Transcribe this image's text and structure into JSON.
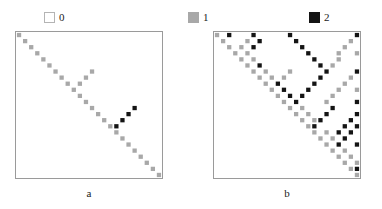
{
  "figure": {
    "width": 382,
    "height": 209,
    "background": "#ffffff"
  },
  "legend": {
    "items": [
      {
        "label": "0",
        "value": 0,
        "color": "#ffffff",
        "border": "#b4b4b4",
        "swatch_name": "legend-swatch-zero"
      },
      {
        "label": "1",
        "value": 1,
        "color": "#a8a8a8",
        "border": "#a8a8a8",
        "swatch_name": "legend-swatch-one"
      },
      {
        "label": "2",
        "value": 2,
        "color": "#141414",
        "border": "#141414",
        "swatch_name": "legend-swatch-two"
      }
    ]
  },
  "panels": [
    {
      "id": "a",
      "caption": "a",
      "matrix_border_color": "#9a9a9a"
    },
    {
      "id": "b",
      "caption": "b",
      "matrix_border_color": "#9a9a9a"
    }
  ],
  "chart_data": [
    {
      "type": "heatmap",
      "title": "a",
      "xlabel": "",
      "ylabel": "",
      "grid": false,
      "legend_position": "top",
      "n_rows": 24,
      "n_cols": 24,
      "value_colors": {
        "0": "#ffffff",
        "1": "#a8a8a8",
        "2": "#141414"
      },
      "value_labels": [
        "0",
        "1",
        "2"
      ],
      "note": "Upper-triangular adjacency-style matrix; 0 = white, 1 = gray, 2 = black.",
      "values": [
        [
          1,
          0,
          0,
          0,
          0,
          0,
          0,
          0,
          0,
          0,
          0,
          0,
          0,
          0,
          0,
          0,
          0,
          0,
          0,
          0,
          0,
          0,
          0,
          0
        ],
        [
          0,
          1,
          0,
          0,
          0,
          0,
          0,
          0,
          0,
          0,
          0,
          0,
          0,
          0,
          0,
          0,
          0,
          0,
          0,
          0,
          0,
          0,
          0,
          0
        ],
        [
          0,
          0,
          1,
          0,
          0,
          0,
          0,
          0,
          0,
          0,
          0,
          0,
          0,
          0,
          0,
          0,
          0,
          0,
          0,
          0,
          0,
          0,
          0,
          0
        ],
        [
          0,
          0,
          0,
          1,
          0,
          0,
          0,
          0,
          0,
          0,
          0,
          0,
          0,
          0,
          0,
          0,
          0,
          0,
          0,
          0,
          0,
          0,
          0,
          0
        ],
        [
          0,
          0,
          0,
          0,
          1,
          0,
          0,
          0,
          0,
          0,
          0,
          0,
          0,
          0,
          0,
          0,
          0,
          0,
          0,
          0,
          0,
          0,
          0,
          0
        ],
        [
          0,
          0,
          0,
          0,
          0,
          1,
          0,
          0,
          0,
          0,
          0,
          0,
          0,
          0,
          0,
          0,
          0,
          0,
          0,
          0,
          0,
          0,
          0,
          0
        ],
        [
          0,
          0,
          0,
          0,
          0,
          0,
          1,
          0,
          0,
          0,
          0,
          0,
          1,
          0,
          0,
          0,
          0,
          0,
          0,
          0,
          0,
          0,
          0,
          0
        ],
        [
          0,
          0,
          0,
          0,
          0,
          0,
          0,
          1,
          0,
          0,
          0,
          1,
          0,
          0,
          0,
          0,
          0,
          0,
          0,
          0,
          0,
          0,
          0,
          0
        ],
        [
          0,
          0,
          0,
          0,
          0,
          0,
          0,
          0,
          1,
          0,
          1,
          0,
          0,
          0,
          0,
          0,
          0,
          0,
          0,
          0,
          0,
          0,
          0,
          0
        ],
        [
          0,
          0,
          0,
          0,
          0,
          0,
          0,
          0,
          0,
          1,
          0,
          0,
          0,
          0,
          0,
          0,
          0,
          0,
          0,
          0,
          0,
          0,
          0,
          0
        ],
        [
          0,
          0,
          0,
          0,
          0,
          0,
          0,
          0,
          0,
          0,
          1,
          0,
          0,
          0,
          0,
          0,
          0,
          0,
          0,
          0,
          0,
          0,
          0,
          0
        ],
        [
          0,
          0,
          0,
          0,
          0,
          0,
          0,
          0,
          0,
          0,
          0,
          1,
          0,
          0,
          0,
          0,
          0,
          0,
          0,
          0,
          0,
          0,
          0,
          0
        ],
        [
          0,
          0,
          0,
          0,
          0,
          0,
          0,
          0,
          0,
          0,
          0,
          0,
          1,
          0,
          0,
          0,
          0,
          0,
          0,
          2,
          0,
          0,
          0,
          0
        ],
        [
          0,
          0,
          0,
          0,
          0,
          0,
          0,
          0,
          0,
          0,
          0,
          0,
          0,
          1,
          0,
          0,
          0,
          0,
          2,
          0,
          0,
          0,
          0,
          0
        ],
        [
          0,
          0,
          0,
          0,
          0,
          0,
          0,
          0,
          0,
          0,
          0,
          0,
          0,
          0,
          1,
          0,
          0,
          2,
          0,
          0,
          0,
          0,
          0,
          0
        ],
        [
          0,
          0,
          0,
          0,
          0,
          0,
          0,
          0,
          0,
          0,
          0,
          0,
          0,
          0,
          0,
          1,
          2,
          0,
          0,
          0,
          0,
          0,
          0,
          0
        ],
        [
          0,
          0,
          0,
          0,
          0,
          0,
          0,
          0,
          0,
          0,
          0,
          0,
          0,
          0,
          0,
          0,
          1,
          0,
          0,
          0,
          0,
          0,
          0,
          0
        ],
        [
          0,
          0,
          0,
          0,
          0,
          0,
          0,
          0,
          0,
          0,
          0,
          0,
          0,
          0,
          0,
          0,
          0,
          1,
          0,
          0,
          0,
          0,
          0,
          0
        ],
        [
          0,
          0,
          0,
          0,
          0,
          0,
          0,
          0,
          0,
          0,
          0,
          0,
          0,
          0,
          0,
          0,
          0,
          0,
          1,
          0,
          0,
          0,
          0,
          0
        ],
        [
          0,
          0,
          0,
          0,
          0,
          0,
          0,
          0,
          0,
          0,
          0,
          0,
          0,
          0,
          0,
          0,
          0,
          0,
          0,
          1,
          0,
          0,
          0,
          0
        ],
        [
          0,
          0,
          0,
          0,
          0,
          0,
          0,
          0,
          0,
          0,
          0,
          0,
          0,
          0,
          0,
          0,
          0,
          0,
          0,
          0,
          1,
          0,
          0,
          0
        ],
        [
          0,
          0,
          0,
          0,
          0,
          0,
          0,
          0,
          0,
          0,
          0,
          0,
          0,
          0,
          0,
          0,
          0,
          0,
          0,
          0,
          0,
          1,
          0,
          0
        ],
        [
          0,
          0,
          0,
          0,
          0,
          0,
          0,
          0,
          0,
          0,
          0,
          0,
          0,
          0,
          0,
          0,
          0,
          0,
          0,
          0,
          0,
          0,
          1,
          0
        ],
        [
          0,
          0,
          0,
          0,
          0,
          0,
          0,
          0,
          0,
          0,
          0,
          0,
          0,
          0,
          0,
          0,
          0,
          0,
          0,
          0,
          0,
          0,
          0,
          1
        ]
      ],
      "diagonals": [
        {
          "name": "main-diagonal",
          "offset": 0,
          "value": 1,
          "from": 0,
          "to": 23
        },
        {
          "name": "anti-diagonal-left",
          "offset": "k=i+j=23 segment",
          "value": 1,
          "from": 0,
          "to": 11
        },
        {
          "name": "block-anti-diagonal",
          "value": 1
        },
        {
          "name": "black-upper-diagonal",
          "value": 2,
          "from_cell": [
            0,
            12
          ],
          "to_cell": [
            11,
            23
          ]
        }
      ]
    },
    {
      "type": "heatmap",
      "title": "b",
      "xlabel": "",
      "ylabel": "",
      "grid": false,
      "legend_position": "top",
      "n_rows": 24,
      "n_cols": 24,
      "value_colors": {
        "0": "#ffffff",
        "1": "#a8a8a8",
        "2": "#141414"
      },
      "value_labels": [
        "0",
        "1",
        "2"
      ],
      "note": "Denser upper-triangular matrix with nested block/anti-diagonal structure; contains more 2 (black) entries than panel a.",
      "values": [
        [
          1,
          0,
          2,
          0,
          0,
          0,
          2,
          0,
          0,
          0,
          0,
          0,
          2,
          0,
          0,
          0,
          0,
          0,
          0,
          0,
          0,
          0,
          0,
          2
        ],
        [
          0,
          1,
          0,
          0,
          0,
          1,
          0,
          2,
          0,
          0,
          0,
          0,
          0,
          2,
          0,
          0,
          0,
          0,
          0,
          0,
          0,
          0,
          1,
          0
        ],
        [
          0,
          0,
          1,
          0,
          1,
          0,
          2,
          0,
          0,
          0,
          0,
          0,
          0,
          0,
          2,
          0,
          0,
          0,
          0,
          0,
          0,
          1,
          0,
          0
        ],
        [
          0,
          0,
          0,
          1,
          0,
          1,
          0,
          0,
          0,
          0,
          0,
          0,
          0,
          0,
          0,
          2,
          0,
          0,
          0,
          0,
          1,
          0,
          0,
          1
        ],
        [
          0,
          0,
          0,
          0,
          1,
          0,
          1,
          0,
          0,
          0,
          0,
          0,
          0,
          0,
          0,
          0,
          2,
          0,
          0,
          0,
          1,
          0,
          0,
          0
        ],
        [
          0,
          0,
          0,
          0,
          0,
          1,
          0,
          2,
          0,
          0,
          0,
          0,
          0,
          0,
          0,
          0,
          0,
          2,
          0,
          1,
          0,
          0,
          0,
          0
        ],
        [
          0,
          0,
          0,
          0,
          0,
          0,
          1,
          0,
          1,
          0,
          0,
          0,
          1,
          0,
          0,
          0,
          0,
          0,
          2,
          0,
          0,
          0,
          0,
          2
        ],
        [
          0,
          0,
          0,
          0,
          0,
          0,
          0,
          1,
          0,
          1,
          0,
          1,
          0,
          0,
          0,
          0,
          0,
          2,
          0,
          0,
          0,
          0,
          1,
          0
        ],
        [
          0,
          0,
          0,
          0,
          0,
          0,
          0,
          0,
          1,
          0,
          2,
          0,
          0,
          0,
          0,
          0,
          2,
          0,
          0,
          0,
          0,
          1,
          0,
          0
        ],
        [
          0,
          0,
          0,
          0,
          0,
          0,
          0,
          0,
          0,
          1,
          0,
          2,
          0,
          0,
          0,
          2,
          0,
          0,
          0,
          0,
          1,
          0,
          0,
          1
        ],
        [
          0,
          0,
          0,
          0,
          0,
          0,
          0,
          0,
          0,
          0,
          1,
          0,
          2,
          0,
          2,
          0,
          0,
          0,
          0,
          1,
          0,
          0,
          0,
          0
        ],
        [
          0,
          0,
          0,
          0,
          0,
          0,
          0,
          0,
          0,
          0,
          0,
          1,
          0,
          2,
          0,
          0,
          0,
          0,
          1,
          0,
          0,
          0,
          0,
          2
        ],
        [
          0,
          0,
          0,
          0,
          0,
          0,
          0,
          0,
          0,
          0,
          0,
          0,
          1,
          0,
          1,
          0,
          0,
          0,
          0,
          2,
          0,
          0,
          0,
          0
        ],
        [
          0,
          0,
          0,
          0,
          0,
          0,
          0,
          0,
          0,
          0,
          0,
          0,
          0,
          1,
          0,
          1,
          0,
          0,
          2,
          0,
          0,
          0,
          0,
          2
        ],
        [
          0,
          0,
          0,
          0,
          0,
          0,
          0,
          0,
          0,
          0,
          0,
          0,
          0,
          0,
          1,
          0,
          1,
          2,
          0,
          0,
          0,
          0,
          2,
          0
        ],
        [
          0,
          0,
          0,
          0,
          0,
          0,
          0,
          0,
          0,
          0,
          0,
          0,
          0,
          0,
          0,
          1,
          2,
          0,
          0,
          0,
          0,
          2,
          0,
          2
        ],
        [
          0,
          0,
          0,
          0,
          0,
          0,
          0,
          0,
          0,
          0,
          0,
          0,
          0,
          0,
          0,
          0,
          1,
          0,
          1,
          0,
          2,
          0,
          2,
          0
        ],
        [
          0,
          0,
          0,
          0,
          0,
          0,
          0,
          0,
          0,
          0,
          0,
          0,
          0,
          0,
          0,
          0,
          0,
          1,
          0,
          1,
          0,
          2,
          0,
          0
        ],
        [
          0,
          0,
          0,
          0,
          0,
          0,
          0,
          0,
          0,
          0,
          0,
          0,
          0,
          0,
          0,
          0,
          0,
          0,
          1,
          0,
          2,
          0,
          0,
          2
        ],
        [
          0,
          0,
          0,
          0,
          0,
          0,
          0,
          0,
          0,
          0,
          0,
          0,
          0,
          0,
          0,
          0,
          0,
          0,
          0,
          1,
          0,
          1,
          0,
          0
        ],
        [
          0,
          0,
          0,
          0,
          0,
          0,
          0,
          0,
          0,
          0,
          0,
          0,
          0,
          0,
          0,
          0,
          0,
          0,
          0,
          0,
          1,
          0,
          1,
          0
        ],
        [
          0,
          0,
          0,
          0,
          0,
          0,
          0,
          0,
          0,
          0,
          0,
          0,
          0,
          0,
          0,
          0,
          0,
          0,
          0,
          0,
          0,
          1,
          0,
          1
        ],
        [
          0,
          0,
          0,
          0,
          0,
          0,
          0,
          0,
          0,
          0,
          0,
          0,
          0,
          0,
          0,
          0,
          0,
          0,
          0,
          0,
          0,
          0,
          1,
          2
        ],
        [
          0,
          0,
          0,
          0,
          0,
          0,
          0,
          0,
          0,
          0,
          0,
          0,
          0,
          0,
          0,
          0,
          0,
          0,
          0,
          0,
          0,
          0,
          0,
          1
        ]
      ]
    }
  ]
}
